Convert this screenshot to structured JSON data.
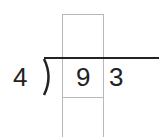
{
  "problem": {
    "type": "long-division",
    "divisor": "4",
    "dividend_digits": [
      "9",
      "3"
    ],
    "highlighted_digit_index": 0
  },
  "colors": {
    "ink": "#222222",
    "box_outline": "#b8b8b8",
    "background": "#ffffff"
  }
}
